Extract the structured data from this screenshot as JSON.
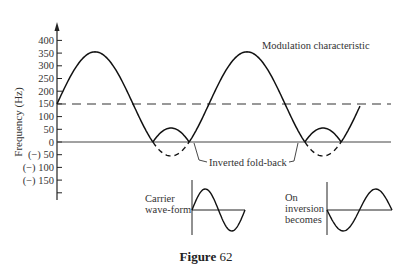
{
  "figure": {
    "caption_bold": "Figure",
    "caption_number": "62"
  },
  "chart_data": {
    "type": "line",
    "title": "",
    "xlabel": "",
    "ylabel": "Frequency (Hz)",
    "ylim": [
      -200,
      420
    ],
    "grid": false,
    "y_ticks": [
      400,
      350,
      300,
      250,
      200,
      150,
      100,
      50,
      0,
      -50,
      -100,
      -150,
      -200
    ],
    "y_tick_labels": [
      "400",
      "350",
      "300",
      "250",
      "200",
      "150",
      "100",
      "50",
      "0",
      "(−) 50",
      "(−) 100",
      "(−) 150",
      ""
    ],
    "reference_lines": [
      {
        "name": "carrier-level",
        "y": 150,
        "style": "dashed"
      },
      {
        "name": "zero-line",
        "y": 0,
        "style": "solid"
      }
    ],
    "series": [
      {
        "name": "Modulation characteristic (folded)",
        "style": "solid",
        "points_description": "Sinusoid about 150 Hz with amplitude ~205 Hz; negative lobes folded back above zero (peaks ~355 Hz, folded humps ~55 Hz)"
      },
      {
        "name": "Inverted fold-back (original negative lobes)",
        "style": "dashed",
        "points_description": "Negative lobes dipping to about -90 Hz"
      }
    ],
    "annotations": [
      {
        "text": "Modulation characteristic"
      },
      {
        "text": "Inverted fold-back"
      },
      {
        "text": "Carrier wave-form"
      },
      {
        "text": "On inversion becomes"
      }
    ]
  },
  "labels": {
    "modulation": "Modulation characteristic",
    "foldback": "Inverted fold-back",
    "carrier_1": "Carrier",
    "carrier_2": "wave-form",
    "inversion_1": "On",
    "inversion_2": "inversion",
    "inversion_3": "becomes",
    "ylabel": "Frequency (Hz)"
  },
  "colors": {
    "ink": "#222222",
    "background": "#ffffff"
  }
}
